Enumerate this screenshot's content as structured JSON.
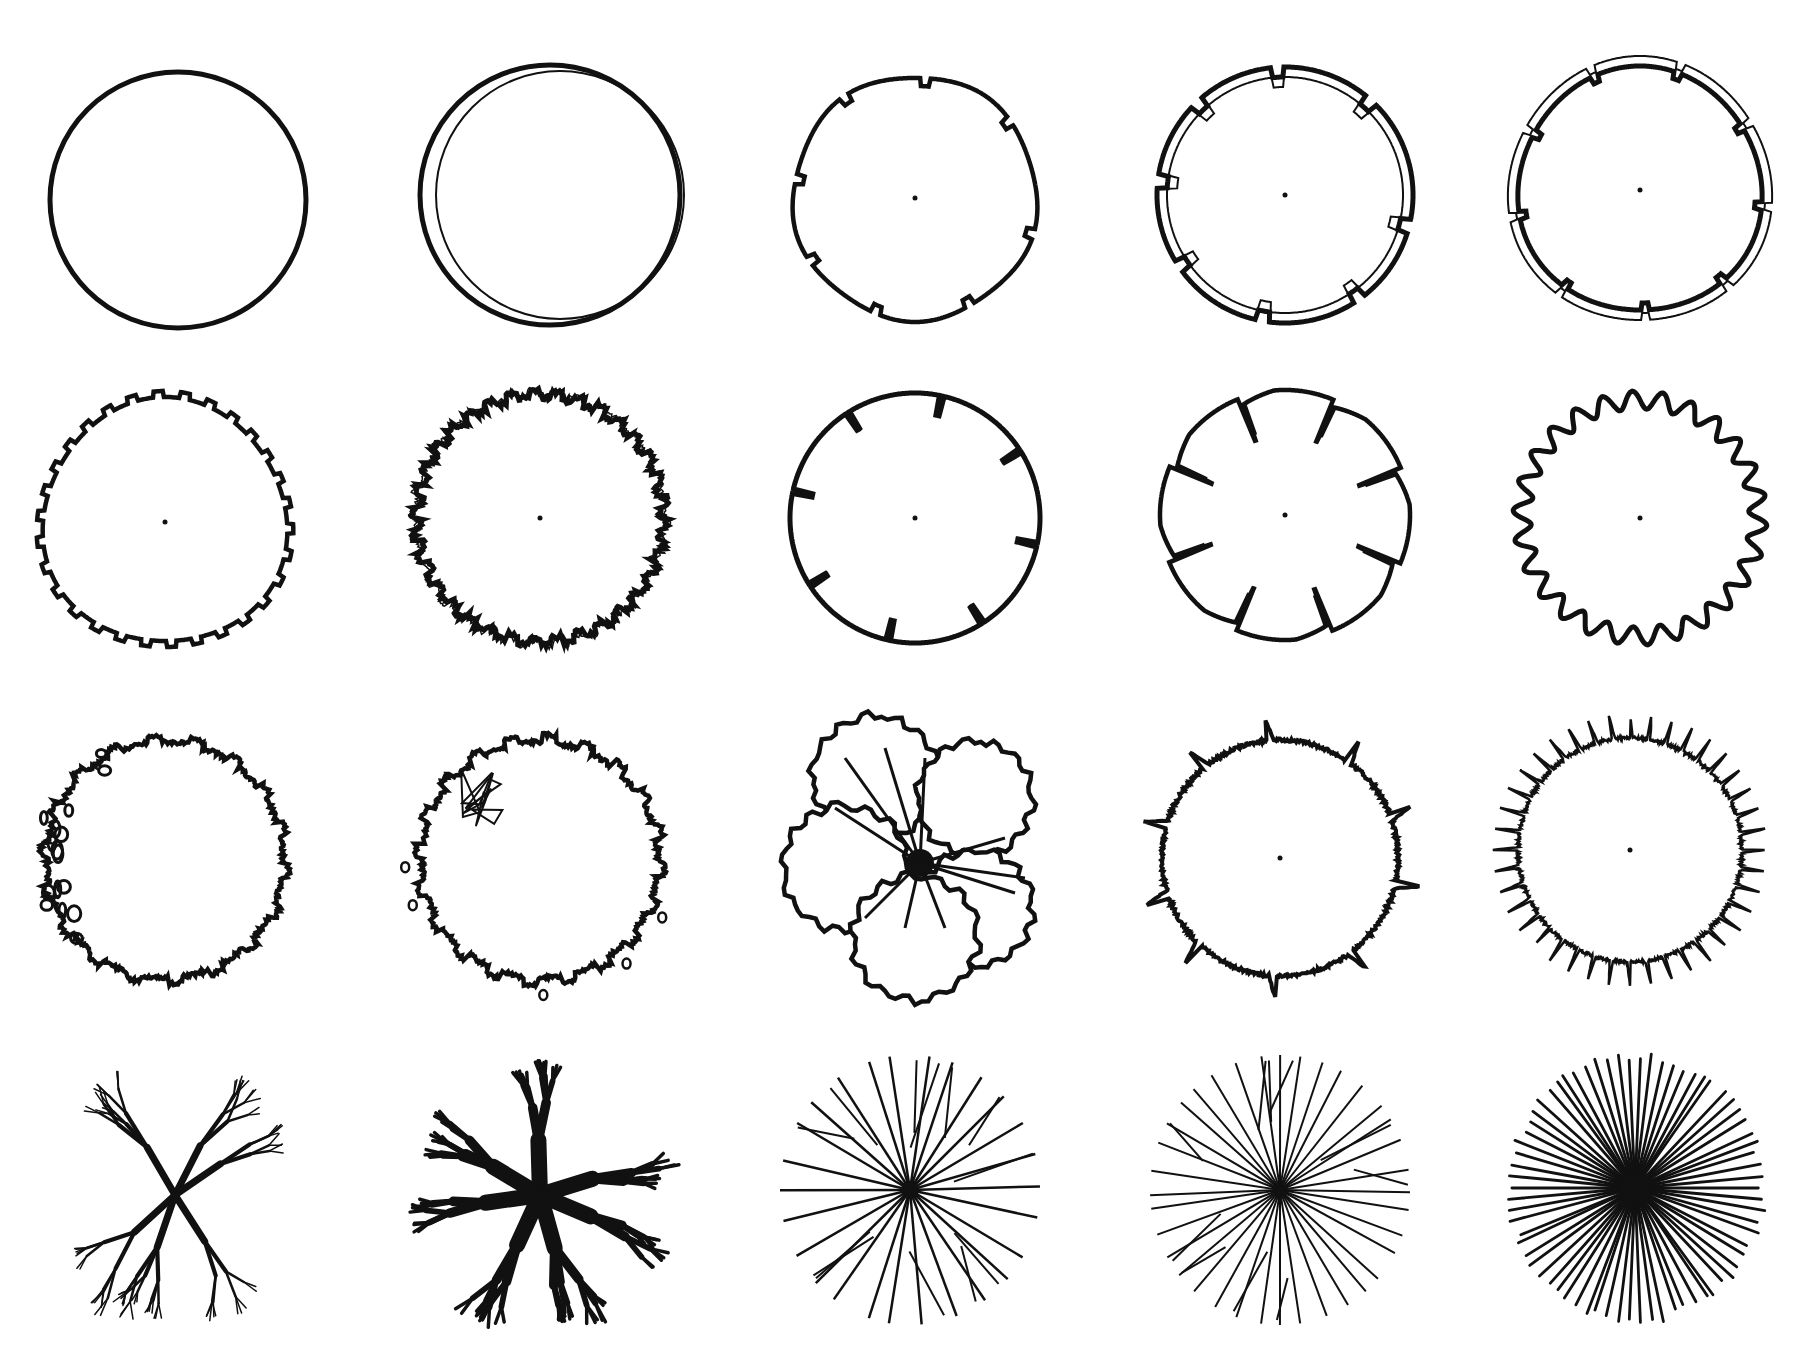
{
  "diagram": {
    "title": "",
    "description": "Plan-view tree / shrub symbol sheet: 20 hand-drawn circular plant symbols arranged in 4 rows x 5 columns",
    "ink_color": "#111111",
    "paper_color": "#ffffff",
    "grid": {
      "rows": 4,
      "columns": 5
    },
    "symbols": [
      {
        "row": 1,
        "col": 1,
        "style": "plain-circle",
        "center_dot": false
      },
      {
        "row": 1,
        "col": 2,
        "style": "double-offset-circle",
        "center_dot": false
      },
      {
        "row": 1,
        "col": 3,
        "style": "notched-circle",
        "center_dot": true
      },
      {
        "row": 1,
        "col": 4,
        "style": "double-ring-stepped-notches",
        "center_dot": true
      },
      {
        "row": 1,
        "col": 5,
        "style": "double-ring-small-notches",
        "center_dot": true
      },
      {
        "row": 2,
        "col": 1,
        "style": "wavy-scalloped-circle",
        "center_dot": true
      },
      {
        "row": 2,
        "col": 2,
        "style": "rough-irregular-circle",
        "center_dot": true
      },
      {
        "row": 2,
        "col": 3,
        "style": "circle-with-8-radial-slits",
        "center_dot": true
      },
      {
        "row": 2,
        "col": 4,
        "style": "lobed-circle-zigzag-cuts",
        "center_dot": true
      },
      {
        "row": 2,
        "col": 5,
        "style": "gear-tooth-wavy-circle",
        "center_dot": true
      },
      {
        "row": 3,
        "col": 1,
        "style": "irregular-outline-with-leaf-dots",
        "center_dot": false
      },
      {
        "row": 3,
        "col": 2,
        "style": "irregular-outline-with-branch-detail",
        "center_dot": false
      },
      {
        "row": 3,
        "col": 3,
        "style": "lobed-canopy-with-trunk-branches",
        "center_dot": false
      },
      {
        "row": 3,
        "col": 4,
        "style": "circle-with-sparse-spikes",
        "center_dot": true
      },
      {
        "row": 3,
        "col": 5,
        "style": "spiky-fringed-circle",
        "center_dot": true
      },
      {
        "row": 4,
        "col": 1,
        "style": "bare-branch-thin",
        "center_dot": false
      },
      {
        "row": 4,
        "col": 2,
        "style": "bare-branch-heavy",
        "center_dot": false
      },
      {
        "row": 4,
        "col": 3,
        "style": "radial-branching-lines",
        "center_dot": false
      },
      {
        "row": 4,
        "col": 4,
        "style": "radial-star-lines",
        "center_dot": false
      },
      {
        "row": 4,
        "col": 5,
        "style": "dense-radial-lines",
        "center_dot": false
      }
    ]
  }
}
